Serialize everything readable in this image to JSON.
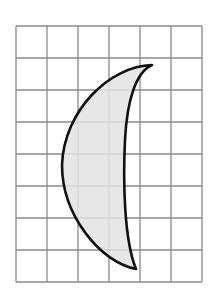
{
  "diagram": {
    "grid": {
      "columns": 6,
      "rows": 8,
      "left": 16,
      "top": 26,
      "cell_width": 31,
      "cell_height": 32,
      "line_color": "#8a8a8a"
    },
    "shape": {
      "type": "crescent",
      "fill_color": "#e3e3e3",
      "stroke_color": "#111111",
      "top_tip": [
        152,
        65
      ],
      "bottom_tip": [
        136,
        269
      ],
      "path": "M152,65 C110,66 64,110 62,165 C62,215 100,262 136,269 C124,240 123,180 125,140 C127,100 136,72 152,65 Z"
    }
  }
}
